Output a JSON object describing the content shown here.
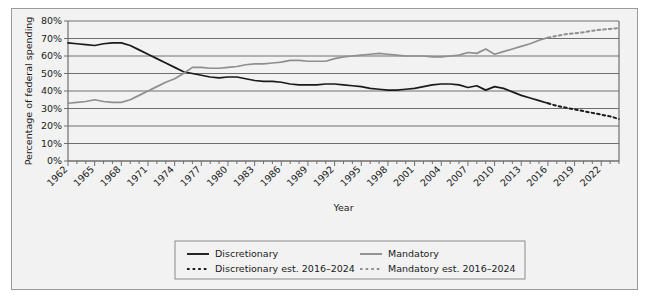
{
  "chart_data": {
    "type": "line",
    "title": "",
    "xlabel": "Year",
    "ylabel": "Percentage of federal spending",
    "ylim": [
      0,
      80
    ],
    "xlim": [
      1962,
      2024
    ],
    "grid": true,
    "ytick_labels": [
      "0%",
      "10%",
      "20%",
      "30%",
      "40%",
      "50%",
      "60%",
      "70%",
      "80%"
    ],
    "ytick_values": [
      0,
      10,
      20,
      30,
      40,
      50,
      60,
      70,
      80
    ],
    "xtick_labels": [
      "1962",
      "1965",
      "1968",
      "1971",
      "1974",
      "1977",
      "1980",
      "1983",
      "1986",
      "1989",
      "1992",
      "1995",
      "1998",
      "2001",
      "2004",
      "2007",
      "2010",
      "2013",
      "2016",
      "2019",
      "2022"
    ],
    "xtick_values": [
      1962,
      1965,
      1968,
      1971,
      1974,
      1977,
      1980,
      1983,
      1986,
      1989,
      1992,
      1995,
      1998,
      2001,
      2004,
      2007,
      2010,
      2013,
      2016,
      2019,
      2022
    ],
    "legend_position": "bottom",
    "colors": {
      "discretionary": "#1a1a1a",
      "mandatory": "#8f8f8f",
      "grid": "#6e6e6e",
      "panel": "#f2f2f2",
      "border": "#9a9a9a"
    },
    "series": [
      {
        "name": "Discretionary",
        "style": "solid",
        "color": "#1a1a1a",
        "x": [
          1962,
          1963,
          1964,
          1965,
          1966,
          1967,
          1968,
          1969,
          1970,
          1971,
          1972,
          1973,
          1974,
          1975,
          1976,
          1977,
          1978,
          1979,
          1980,
          1981,
          1982,
          1983,
          1984,
          1985,
          1986,
          1987,
          1988,
          1989,
          1990,
          1991,
          1992,
          1993,
          1994,
          1995,
          1996,
          1997,
          1998,
          1999,
          2000,
          2001,
          2002,
          2003,
          2004,
          2005,
          2006,
          2007,
          2008,
          2009,
          2010,
          2011,
          2012,
          2013,
          2014,
          2015,
          2016
        ],
        "values": [
          67.5,
          67.0,
          66.5,
          66.0,
          67.0,
          67.5,
          67.5,
          66.0,
          63.5,
          61.0,
          58.5,
          56.0,
          53.5,
          51.0,
          50.0,
          49.0,
          48.0,
          47.5,
          48.0,
          48.0,
          47.0,
          46.0,
          45.5,
          45.5,
          45.0,
          44.0,
          43.5,
          43.5,
          43.5,
          44.0,
          44.0,
          43.5,
          43.0,
          42.5,
          41.5,
          41.0,
          40.5,
          40.5,
          41.0,
          41.5,
          42.5,
          43.5,
          44.0,
          44.0,
          43.5,
          42.0,
          43.0,
          40.5,
          42.5,
          41.5,
          39.5,
          37.5,
          36.0,
          34.5,
          33.0
        ]
      },
      {
        "name": "Mandatory",
        "style": "solid",
        "color": "#8f8f8f",
        "x": [
          1962,
          1963,
          1964,
          1965,
          1966,
          1967,
          1968,
          1969,
          1970,
          1971,
          1972,
          1973,
          1974,
          1975,
          1976,
          1977,
          1978,
          1979,
          1980,
          1981,
          1982,
          1983,
          1984,
          1985,
          1986,
          1987,
          1988,
          1989,
          1990,
          1991,
          1992,
          1993,
          1994,
          1995,
          1996,
          1997,
          1998,
          1999,
          2000,
          2001,
          2002,
          2003,
          2004,
          2005,
          2006,
          2007,
          2008,
          2009,
          2010,
          2011,
          2012,
          2013,
          2014,
          2015,
          2016
        ],
        "values": [
          33.0,
          33.5,
          34.0,
          35.0,
          34.0,
          33.5,
          33.5,
          35.0,
          37.5,
          40.0,
          42.5,
          45.0,
          47.0,
          50.0,
          53.5,
          53.5,
          53.0,
          53.0,
          53.5,
          54.0,
          55.0,
          55.5,
          55.5,
          56.0,
          56.5,
          57.5,
          57.5,
          57.0,
          57.0,
          57.0,
          58.5,
          59.5,
          60.0,
          60.5,
          61.0,
          61.5,
          61.0,
          60.5,
          60.0,
          60.0,
          60.0,
          59.5,
          59.5,
          60.0,
          60.5,
          62.0,
          61.5,
          64.0,
          61.0,
          62.5,
          64.0,
          65.5,
          67.0,
          69.0,
          70.5
        ]
      },
      {
        "name": "Discretionary est. 2016–2024",
        "style": "dashed",
        "color": "#1a1a1a",
        "x": [
          2016,
          2017,
          2018,
          2019,
          2020,
          2021,
          2022,
          2023,
          2024
        ],
        "values": [
          33.0,
          31.5,
          30.5,
          29.5,
          28.5,
          27.5,
          26.5,
          25.5,
          24.0
        ]
      },
      {
        "name": "Mandatory est. 2016–2024",
        "style": "dashed",
        "color": "#8f8f8f",
        "x": [
          2016,
          2017,
          2018,
          2019,
          2020,
          2021,
          2022,
          2023,
          2024
        ],
        "values": [
          70.5,
          71.5,
          72.5,
          73.0,
          73.5,
          74.5,
          75.0,
          75.5,
          76.0
        ]
      }
    ],
    "legend": [
      {
        "label": "Discretionary",
        "style": "solid",
        "color": "#1a1a1a"
      },
      {
        "label": "Mandatory",
        "style": "solid",
        "color": "#8f8f8f"
      },
      {
        "label": "Discretionary est. 2016–2024",
        "style": "dashed",
        "color": "#1a1a1a"
      },
      {
        "label": "Mandatory est. 2016–2024",
        "style": "dashed",
        "color": "#8f8f8f"
      }
    ]
  }
}
